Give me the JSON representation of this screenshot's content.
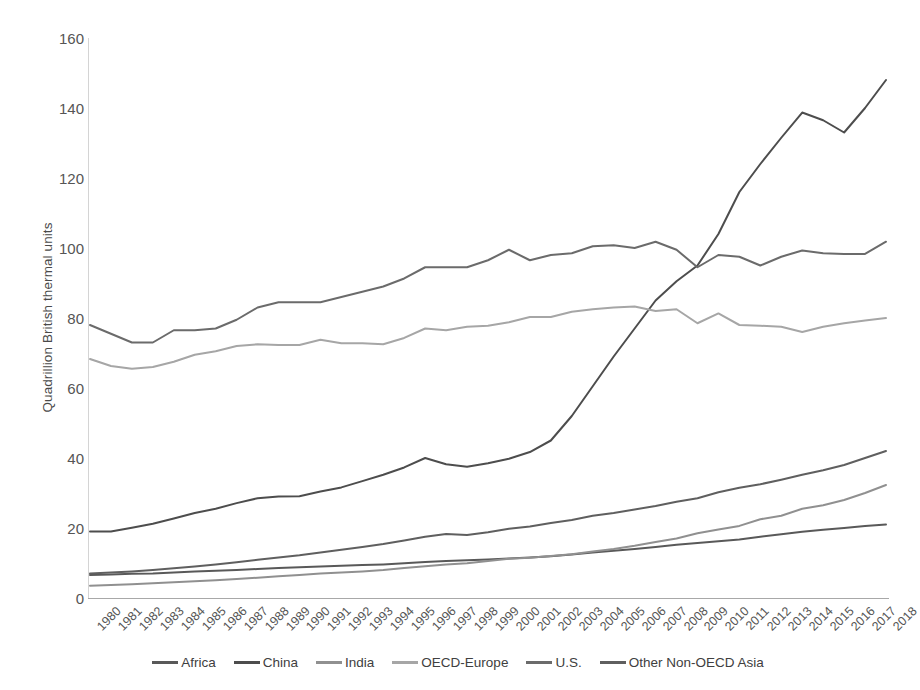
{
  "chart_data": {
    "type": "line",
    "title": "",
    "xlabel": "",
    "ylabel": "Quadrillion British thermal units",
    "ylim": [
      0,
      160
    ],
    "yticks": [
      0,
      20,
      40,
      60,
      80,
      100,
      120,
      140,
      160
    ],
    "grid": false,
    "legend_position": "bottom",
    "x": [
      1980,
      1981,
      1982,
      1983,
      1984,
      1985,
      1986,
      1987,
      1988,
      1989,
      1990,
      1991,
      1992,
      1993,
      1994,
      1995,
      1996,
      1997,
      1998,
      1999,
      2000,
      2001,
      2002,
      2003,
      2004,
      2005,
      2006,
      2007,
      2008,
      2009,
      2010,
      2011,
      2012,
      2013,
      2014,
      2015,
      2016,
      2017,
      2018
    ],
    "series": [
      {
        "name": "Africa",
        "color": "#595959",
        "values": [
          6.6,
          6.7,
          6.9,
          7.0,
          7.3,
          7.6,
          7.8,
          8.0,
          8.3,
          8.6,
          8.8,
          9.0,
          9.2,
          9.4,
          9.6,
          9.9,
          10.3,
          10.6,
          10.8,
          11.0,
          11.3,
          11.6,
          11.9,
          12.4,
          13.0,
          13.5,
          14.0,
          14.6,
          15.2,
          15.7,
          16.2,
          16.7,
          17.5,
          18.2,
          18.9,
          19.5,
          20.0,
          20.6,
          21.0
        ]
      },
      {
        "name": "China",
        "color": "#4d4d4d",
        "values": [
          19.0,
          19.0,
          20.1,
          21.2,
          22.7,
          24.3,
          25.5,
          27.1,
          28.5,
          29.0,
          29.1,
          30.4,
          31.6,
          33.4,
          35.2,
          37.3,
          40.0,
          38.2,
          37.5,
          38.5,
          39.8,
          41.7,
          45.0,
          52.0,
          60.5,
          69.0,
          77.0,
          85.0,
          90.5,
          95.0,
          104.0,
          116.0,
          124.0,
          131.5,
          138.7,
          136.5,
          133.0,
          140.0,
          148.0
        ]
      },
      {
        "name": "India",
        "color": "#909090",
        "values": [
          3.5,
          3.7,
          3.9,
          4.2,
          4.5,
          4.8,
          5.1,
          5.4,
          5.8,
          6.2,
          6.6,
          7.0,
          7.3,
          7.6,
          8.0,
          8.6,
          9.1,
          9.6,
          9.9,
          10.6,
          11.2,
          11.5,
          12.0,
          12.5,
          13.3,
          14.0,
          14.9,
          16.0,
          17.0,
          18.5,
          19.6,
          20.6,
          22.5,
          23.5,
          25.5,
          26.5,
          28.0,
          30.0,
          32.3
        ]
      },
      {
        "name": "OECD-Europe",
        "color": "#a6a6a6",
        "values": [
          68.3,
          66.3,
          65.5,
          66.0,
          67.5,
          69.5,
          70.5,
          72.0,
          72.5,
          72.3,
          72.3,
          73.8,
          72.8,
          72.8,
          72.5,
          74.3,
          77.0,
          76.5,
          77.5,
          77.8,
          78.8,
          80.3,
          80.3,
          81.8,
          82.5,
          83.0,
          83.3,
          82.0,
          82.5,
          78.5,
          81.3,
          78.0,
          77.8,
          77.5,
          76.0,
          77.5,
          78.5,
          79.3,
          80.0
        ]
      },
      {
        "name": "U.S.",
        "color": "#6b6b6b",
        "values": [
          78.0,
          75.5,
          73.0,
          73.0,
          76.5,
          76.5,
          77.0,
          79.5,
          83.0,
          84.5,
          84.5,
          84.5,
          86.0,
          87.5,
          89.0,
          91.3,
          94.5,
          94.5,
          94.5,
          96.5,
          99.5,
          96.5,
          98.0,
          98.5,
          100.5,
          100.8,
          100.0,
          101.8,
          99.5,
          94.5,
          98.0,
          97.5,
          95.0,
          97.5,
          99.3,
          98.5,
          98.3,
          98.3,
          101.8
        ]
      },
      {
        "name": "Other Non-OECD Asia",
        "color": "#5f5f5f",
        "values": [
          7.0,
          7.3,
          7.6,
          8.0,
          8.5,
          9.0,
          9.6,
          10.2,
          10.9,
          11.6,
          12.2,
          13.0,
          13.8,
          14.6,
          15.4,
          16.4,
          17.5,
          18.3,
          18.0,
          18.8,
          19.8,
          20.4,
          21.4,
          22.3,
          23.5,
          24.3,
          25.3,
          26.3,
          27.5,
          28.5,
          30.2,
          31.5,
          32.5,
          33.8,
          35.2,
          36.5,
          38.0,
          40.0,
          42.0
        ]
      }
    ]
  },
  "axes": {
    "y_title": "Quadrillion British thermal units"
  },
  "legend": {
    "items": [
      {
        "label": "Africa",
        "color": "#595959"
      },
      {
        "label": "China",
        "color": "#4d4d4d"
      },
      {
        "label": "India",
        "color": "#909090"
      },
      {
        "label": "OECD-Europe",
        "color": "#a6a6a6"
      },
      {
        "label": "U.S.",
        "color": "#6b6b6b"
      },
      {
        "label": "Other Non-OECD Asia",
        "color": "#5f5f5f"
      }
    ]
  }
}
